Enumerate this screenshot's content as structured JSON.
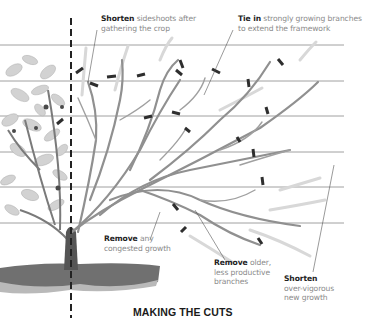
{
  "title": "MAKING THE CUTS",
  "annotations": [
    {
      "id": "shorten-sideshoots",
      "bold": "Shorten",
      "text": "sideshoots after",
      "line2": "gathering the crop"
    },
    {
      "id": "tie-in",
      "bold": "Tie in",
      "text": "strongly growing branches",
      "line2": "to extend the framework"
    },
    {
      "id": "remove-congested",
      "bold": "Remove",
      "text": "any",
      "line2": "congested growth"
    },
    {
      "id": "remove-older",
      "bold": "Remove",
      "text": "older,",
      "line2": "less productive",
      "line3": "branches"
    },
    {
      "id": "shorten-vigorous",
      "bold": "Shorten",
      "text": "",
      "line2": "over-vigorous",
      "line3": "new growth"
    }
  ],
  "colors": {
    "wire": "#9a9a9a",
    "branch": "#8c8c8c",
    "new_growth": "#d4d4d4",
    "cut_mark": "#333333",
    "soil": "#6e6e6e",
    "foliage": "#c8c8c8",
    "guide_line": "#222222"
  },
  "wires_y": [
    45,
    81,
    116,
    152,
    187,
    223
  ]
}
